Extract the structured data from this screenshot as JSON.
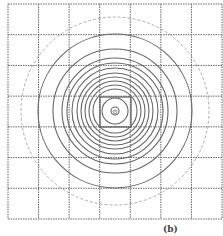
{
  "diagram": {
    "grid": {
      "x0": 8,
      "y0": 4,
      "x1": 222,
      "y1": 219,
      "cols": 7,
      "rows": 7,
      "color": "#666666"
    },
    "center": {
      "x": 115,
      "y": 111,
      "marker": "⊙"
    },
    "circles": [
      {
        "r": 4,
        "style": "solid"
      },
      {
        "r": 13,
        "style": "solid"
      },
      {
        "r": 22,
        "style": "solid"
      },
      {
        "r": 26,
        "style": "solid"
      },
      {
        "r": 30,
        "style": "solid"
      },
      {
        "r": 34,
        "style": "solid"
      },
      {
        "r": 38,
        "style": "solid"
      },
      {
        "r": 43,
        "style": "solid"
      },
      {
        "r": 48,
        "style": "solid"
      },
      {
        "r": 53,
        "style": "solid"
      },
      {
        "r": 62,
        "style": "solid"
      },
      {
        "r": 77,
        "style": "solid"
      },
      {
        "r": 94,
        "style": "dashed"
      }
    ],
    "center_box": {
      "x": 100,
      "y": 97,
      "w": 31,
      "h": 30
    },
    "caption": "(b)"
  }
}
